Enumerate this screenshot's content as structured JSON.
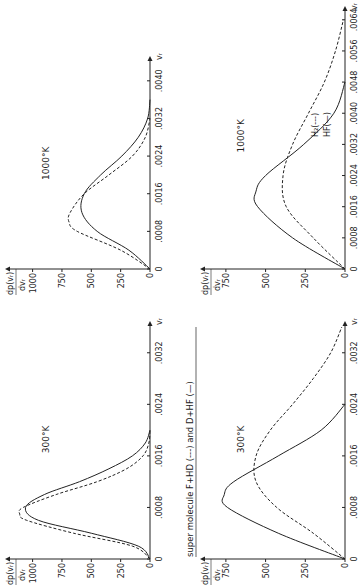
{
  "figure": {
    "caption_top": "super molecule F+HD (---) and D+HF (—)",
    "legend_bottom": {
      "h2": "H₂(---)",
      "hf": "HF(—)"
    },
    "ylabel_num": "dp(vᵣ)",
    "ylabel_den": "dvᵣ",
    "xlabel": "vᵣ"
  },
  "chart_data": [
    {
      "type": "line",
      "panel": "super-molecule-300K",
      "title": "300°K",
      "xlabel": "v_r",
      "ylabel": "dp(v_r)/dv_r",
      "xticks": [
        "0",
        ".0008",
        ".0016",
        ".0024",
        ".0032"
      ],
      "yticks": [
        "0",
        "250",
        "500",
        "750",
        "1000"
      ],
      "xlim": [
        0,
        0.0036
      ],
      "ylim": [
        0,
        1150
      ],
      "series": [
        {
          "name": "F+HD (dashed)",
          "style": "dashed",
          "x": [
            0,
            0.0002,
            0.0004,
            0.0006,
            0.0007,
            0.0008,
            0.001,
            0.0012,
            0.0014,
            0.0016,
            0.0018,
            0.002
          ],
          "y": [
            0,
            150,
            650,
            1050,
            1110,
            1080,
            800,
            450,
            200,
            60,
            10,
            0
          ]
        },
        {
          "name": "D+HF (solid)",
          "style": "solid",
          "x": [
            0,
            0.0002,
            0.0004,
            0.0006,
            0.0008,
            0.001,
            0.0012,
            0.0014,
            0.0016,
            0.0018,
            0.002
          ],
          "y": [
            0,
            100,
            500,
            950,
            1060,
            900,
            600,
            350,
            150,
            40,
            0
          ]
        }
      ]
    },
    {
      "type": "line",
      "panel": "super-molecule-1000K",
      "title": "1000°K",
      "xlabel": "v_r",
      "ylabel": "dp(v_r)/dv_r",
      "xticks": [
        "0",
        ".0008",
        ".0016",
        ".0024",
        ".0032",
        ".0040"
      ],
      "yticks": [
        "0",
        "250",
        "500",
        "750",
        "1000"
      ],
      "xlim": [
        0,
        0.0044
      ],
      "ylim": [
        0,
        1150
      ],
      "series": [
        {
          "name": "F+HD (dashed)",
          "style": "dashed",
          "x": [
            0,
            0.0004,
            0.0008,
            0.001,
            0.0012,
            0.0016,
            0.002,
            0.0024,
            0.0028,
            0.0032
          ],
          "y": [
            0,
            250,
            620,
            690,
            680,
            560,
            350,
            150,
            40,
            0
          ]
        },
        {
          "name": "D+HF (solid)",
          "style": "solid",
          "x": [
            0,
            0.0004,
            0.0008,
            0.0012,
            0.0016,
            0.002,
            0.0024,
            0.0028,
            0.0032,
            0.0036
          ],
          "y": [
            0,
            180,
            450,
            580,
            560,
            420,
            240,
            100,
            20,
            0
          ]
        }
      ]
    },
    {
      "type": "line",
      "panel": "h2-hf-300K",
      "title": "300°K",
      "xlabel": "v_r",
      "ylabel": "dp(v_r)/dv_r",
      "xticks": [
        "0",
        ".0008",
        ".0016",
        ".0024",
        ".0032"
      ],
      "yticks": [
        "0",
        "250",
        "500",
        "750"
      ],
      "xlim": [
        0,
        0.0036
      ],
      "ylim": [
        0,
        850
      ],
      "series": [
        {
          "name": "H2 (dashed)",
          "style": "dashed",
          "x": [
            0,
            0.0004,
            0.0008,
            0.0012,
            0.0016,
            0.002,
            0.0024,
            0.0028,
            0.0032,
            0.0036
          ],
          "y": [
            0,
            200,
            430,
            560,
            560,
            470,
            330,
            200,
            90,
            20
          ]
        },
        {
          "name": "HF (solid)",
          "style": "solid",
          "x": [
            0,
            0.0004,
            0.0008,
            0.001,
            0.0012,
            0.0016,
            0.002,
            0.0024
          ],
          "y": [
            0,
            420,
            740,
            760,
            700,
            420,
            150,
            0
          ]
        }
      ]
    },
    {
      "type": "line",
      "panel": "h2-hf-1000K",
      "title": "1000°K",
      "xlabel": "v_r",
      "ylabel": "dp(v_r)/dv_r",
      "xticks": [
        "0",
        ".0008",
        ".0016",
        ".0024",
        ".0032",
        ".0040",
        ".0048",
        ".0056",
        ".0064"
      ],
      "yticks": [
        "0",
        "250",
        "500",
        "750"
      ],
      "xlim": [
        0,
        0.0066
      ],
      "ylim": [
        0,
        850
      ],
      "series": [
        {
          "name": "H2 (dashed)",
          "style": "dashed",
          "x": [
            0,
            0.0008,
            0.0016,
            0.0024,
            0.0032,
            0.004,
            0.0048,
            0.0056,
            0.0064
          ],
          "y": [
            0,
            200,
            370,
            390,
            330,
            230,
            130,
            60,
            10
          ]
        },
        {
          "name": "HF (solid)",
          "style": "solid",
          "x": [
            0,
            0.0008,
            0.0016,
            0.002,
            0.0024,
            0.0032,
            0.004,
            0.0048
          ],
          "y": [
            0,
            330,
            550,
            560,
            500,
            260,
            70,
            0
          ]
        }
      ]
    }
  ]
}
